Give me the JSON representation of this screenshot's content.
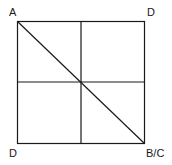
{
  "diagram": {
    "type": "square-grid-with-diagonal",
    "square": {
      "x": 17,
      "y": 21,
      "size": 127
    },
    "stroke_color": "#1a1a1a",
    "background": "#ffffff",
    "labels": {
      "top_left": "A",
      "top_right": "D",
      "bottom_left": "D",
      "bottom_right": "B/C"
    },
    "lines": [
      {
        "name": "vertical-midline"
      },
      {
        "name": "horizontal-midline"
      },
      {
        "name": "diagonal-top-left-to-bottom-right"
      }
    ]
  }
}
